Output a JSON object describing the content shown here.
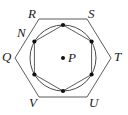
{
  "figure": {
    "stroke_color": "#3a3a3a",
    "point_color": "#111111",
    "background": "#ffffff",
    "center_label": "P",
    "center_point": {
      "x": 63,
      "y": 58
    },
    "circle": {
      "cx": 63,
      "cy": 58,
      "r": 33
    },
    "inner_hexagon": {
      "description": "hexagon inscribed in circle, vertices marked with dots",
      "vertices": [
        {
          "name": "top",
          "x": 63,
          "y": 25
        },
        {
          "name": "upper-right",
          "x": 91.6,
          "y": 41.5
        },
        {
          "name": "lower-right",
          "x": 91.6,
          "y": 74.5
        },
        {
          "name": "bottom",
          "x": 63,
          "y": 91
        },
        {
          "name": "lower-left",
          "x": 34.4,
          "y": 74.5
        },
        {
          "name": "upper-left",
          "x": 34.4,
          "y": 41.5
        }
      ]
    },
    "outer_hexagon": {
      "description": "hexagon circumscribed about circle",
      "vertices": [
        {
          "label": "R",
          "x": 39,
          "y": 19
        },
        {
          "label": "S",
          "x": 87,
          "y": 19
        },
        {
          "label": "T",
          "x": 111,
          "y": 58
        },
        {
          "label": "U",
          "x": 87,
          "y": 97
        },
        {
          "label": "V",
          "x": 39,
          "y": 97
        },
        {
          "label": "Q",
          "x": 15,
          "y": 58
        }
      ]
    },
    "labels": [
      {
        "id": "label-R",
        "text": "R",
        "x": 28,
        "y": 7
      },
      {
        "id": "label-S",
        "text": "S",
        "x": 88,
        "y": 7
      },
      {
        "id": "label-N",
        "text": "N",
        "x": 17,
        "y": 26
      },
      {
        "id": "label-Q",
        "text": "Q",
        "x": 2,
        "y": 50
      },
      {
        "id": "label-T",
        "text": "T",
        "x": 114,
        "y": 50
      },
      {
        "id": "label-V",
        "text": "V",
        "x": 29,
        "y": 96
      },
      {
        "id": "label-U",
        "text": "U",
        "x": 89,
        "y": 96
      },
      {
        "id": "label-P",
        "text": "P",
        "x": 68,
        "y": 51
      }
    ],
    "marked_points": [
      {
        "id": "point-top",
        "x": 63,
        "y": 25
      },
      {
        "id": "point-upper-right",
        "x": 91.6,
        "y": 41.5
      },
      {
        "id": "point-lower-right",
        "x": 91.6,
        "y": 74.5
      },
      {
        "id": "point-bottom",
        "x": 63,
        "y": 91
      },
      {
        "id": "point-lower-left",
        "x": 34.4,
        "y": 74.5
      },
      {
        "id": "point-upper-left-N",
        "x": 34.4,
        "y": 41.5
      },
      {
        "id": "point-center-P",
        "x": 63,
        "y": 58
      }
    ]
  }
}
